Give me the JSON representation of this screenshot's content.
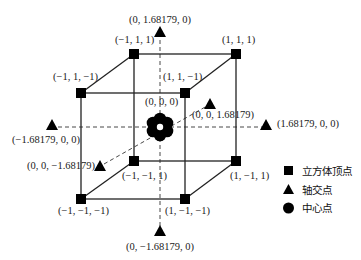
{
  "diagram": {
    "type": "central-composite-design",
    "cube_vertices": [
      {
        "label": "(−1, 1, 1)",
        "coords": [
          -1,
          1,
          1
        ]
      },
      {
        "label": "(1, 1, 1)",
        "coords": [
          1,
          1,
          1
        ]
      },
      {
        "label": "(−1, 1, −1)",
        "coords": [
          -1,
          1,
          -1
        ]
      },
      {
        "label": "(1, 1, −1)",
        "coords": [
          1,
          1,
          -1
        ]
      },
      {
        "label": "(−1, −1, 1)",
        "coords": [
          -1,
          -1,
          1
        ]
      },
      {
        "label": "(1, −1, 1)",
        "coords": [
          1,
          -1,
          1
        ]
      },
      {
        "label": "(−1, −1, −1)",
        "coords": [
          -1,
          -1,
          -1
        ]
      },
      {
        "label": "(1, −1, −1)",
        "coords": [
          1,
          -1,
          -1
        ]
      }
    ],
    "axial_points": [
      {
        "label": "(0, 1.68179, 0)",
        "coords": [
          0,
          1.68179,
          0
        ]
      },
      {
        "label": "(0, −1.68179, 0)",
        "coords": [
          0,
          -1.68179,
          0
        ]
      },
      {
        "label": "(−1.68179, 0, 0)",
        "coords": [
          -1.68179,
          0,
          0
        ]
      },
      {
        "label": "(1.68179, 0, 0)",
        "coords": [
          1.68179,
          0,
          0
        ]
      },
      {
        "label": "(0, 0, 1.68179)",
        "coords": [
          0,
          0,
          1.68179
        ]
      },
      {
        "label": "(0, 0, −1.68179)",
        "coords": [
          0,
          0,
          -1.68179
        ]
      }
    ],
    "center_point": {
      "label": "(0, 0, 0)",
      "coords": [
        0,
        0,
        0
      ],
      "replicates": 6
    },
    "legend": [
      {
        "symbol": "square",
        "label": "立方体顶点"
      },
      {
        "symbol": "triangle",
        "label": "轴交点"
      },
      {
        "symbol": "circle",
        "label": "中心点"
      }
    ],
    "colors": {
      "line": "#222222",
      "marker": "#000000",
      "background": "#ffffff"
    }
  }
}
